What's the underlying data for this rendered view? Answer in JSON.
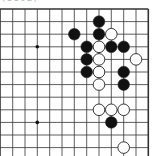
{
  "diagram": {
    "caption": "(1102)",
    "board": {
      "columns": 12,
      "rows": 12,
      "col_x": [
        12.7,
        25,
        37.3,
        49.7,
        62,
        74.3,
        86.7,
        99,
        111.3,
        123.7,
        136,
        148.3
      ],
      "row_y": [
        9,
        21.6,
        34.2,
        46.8,
        59.4,
        72,
        84.6,
        97.2,
        109.8,
        122.4,
        135,
        147.6
      ],
      "edges": {
        "top": true,
        "right": true,
        "left": false,
        "bottom": false
      },
      "line_color": "#333333",
      "star_points": [
        {
          "col": 2,
          "row": 3
        },
        {
          "col": 2,
          "row": 9
        }
      ]
    },
    "stones": [
      {
        "color": "black",
        "col": 7,
        "row": 1
      },
      {
        "color": "black",
        "col": 5,
        "row": 2
      },
      {
        "color": "black",
        "col": 7,
        "row": 2
      },
      {
        "color": "white",
        "col": 8,
        "row": 2
      },
      {
        "color": "black",
        "col": 6,
        "row": 3
      },
      {
        "color": "white",
        "col": 7,
        "row": 3
      },
      {
        "color": "black",
        "col": 8,
        "row": 3
      },
      {
        "color": "black",
        "col": 9,
        "row": 3
      },
      {
        "color": "black",
        "col": 6,
        "row": 4
      },
      {
        "color": "white",
        "col": 7,
        "row": 4
      },
      {
        "color": "white",
        "col": 10,
        "row": 4
      },
      {
        "color": "black",
        "col": 6,
        "row": 5
      },
      {
        "color": "white",
        "col": 7,
        "row": 5
      },
      {
        "color": "black",
        "col": 9,
        "row": 5
      },
      {
        "color": "white",
        "col": 7,
        "row": 6
      },
      {
        "color": "black",
        "col": 9,
        "row": 6
      },
      {
        "color": "white",
        "col": 7,
        "row": 8
      },
      {
        "color": "white",
        "col": 8,
        "row": 8
      },
      {
        "color": "white",
        "col": 9,
        "row": 8
      },
      {
        "color": "black",
        "col": 8,
        "row": 9
      },
      {
        "color": "white",
        "col": 9,
        "row": 11
      }
    ]
  }
}
